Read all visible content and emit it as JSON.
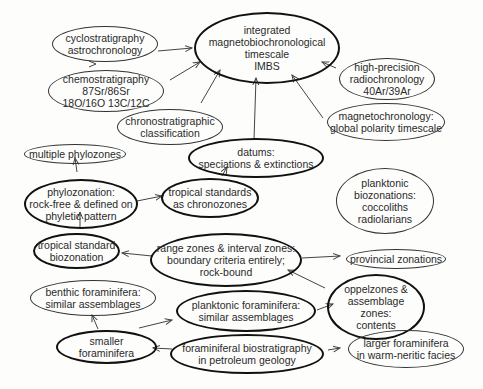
{
  "diagram": {
    "nodes": [
      {
        "id": "imbs",
        "label": "integrated\nmagnetobiochronological\ntimescale\nIMBS"
      },
      {
        "id": "cyclo",
        "label": "cyclostratigraphy\nastrochronology"
      },
      {
        "id": "chemo",
        "label": "chemostratigraphy\n87Sr/86Sr\n18O/16O 13C/12C"
      },
      {
        "id": "radio",
        "label": "high-precision\nradiochronology\n40Ar/39Ar"
      },
      {
        "id": "chrono",
        "label": "chronostratigraphic\nclassification"
      },
      {
        "id": "magneto",
        "label": "magnetochronology:\nglobal polarity timescale"
      },
      {
        "id": "multi",
        "label": "multiple phylozones"
      },
      {
        "id": "datums",
        "label": "datums:\nspeciations & extinctions"
      },
      {
        "id": "phylo",
        "label": "phylozonation:\nrock-free & defined on\nphyletic pattern"
      },
      {
        "id": "tropchron",
        "label": "tropical standards\nas chronozones"
      },
      {
        "id": "plankbio",
        "label": "planktonic\nbiozonations:\ncoccoliths\nradiolarians"
      },
      {
        "id": "tropbio",
        "label": "tropical standard\nbiozonation"
      },
      {
        "id": "range",
        "label": "range zones & interval zones:\nboundary criteria entirely;\nrock-bound"
      },
      {
        "id": "prov",
        "label": "provincial zonations"
      },
      {
        "id": "benthic",
        "label": "benthic foraminifera:\nsimilar assemblages"
      },
      {
        "id": "plankfor",
        "label": "planktonic foraminifera:\nsimilar assemblages"
      },
      {
        "id": "oppel",
        "label": "oppelzones &\nassemblage\nzones:\ncontents"
      },
      {
        "id": "smaller",
        "label": "smaller\nforaminifera"
      },
      {
        "id": "petro",
        "label": "foraminiferal biostratigraphy\nin petroleum geology"
      },
      {
        "id": "larger",
        "label": "larger foraminifera\nin warm-neritic facies"
      }
    ]
  }
}
